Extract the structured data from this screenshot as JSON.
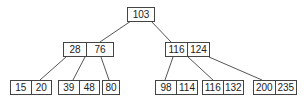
{
  "tree": {
    "root": {
      "keys": [
        "103"
      ]
    },
    "internal": [
      {
        "keys": [
          "28",
          "76"
        ]
      },
      {
        "keys": [
          "116",
          "124"
        ]
      }
    ],
    "leaves": [
      {
        "keys": [
          "15",
          "20"
        ]
      },
      {
        "keys": [
          "39",
          "48"
        ]
      },
      {
        "keys": [
          "80"
        ]
      },
      {
        "keys": [
          "98",
          "114"
        ]
      },
      {
        "keys": [
          "116",
          "132"
        ]
      },
      {
        "keys": [
          "200",
          "235"
        ]
      }
    ]
  }
}
